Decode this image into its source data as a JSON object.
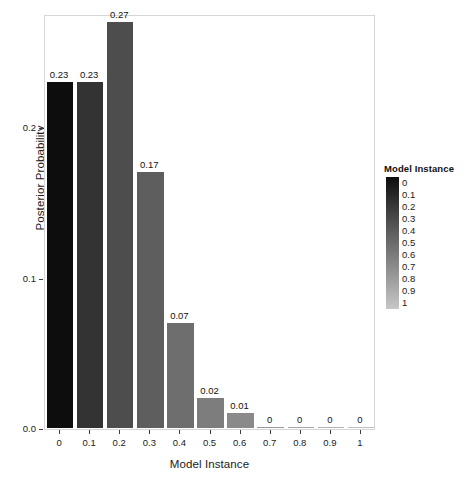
{
  "chart_data": {
    "type": "bar",
    "title": "",
    "xlabel": "Model Instance",
    "ylabel": "Posterior Probability",
    "categories": [
      "0",
      "0.1",
      "0.2",
      "0.3",
      "0.4",
      "0.5",
      "0.6",
      "0.7",
      "0.8",
      "0.9",
      "1"
    ],
    "values": [
      0.23,
      0.23,
      0.27,
      0.17,
      0.07,
      0.02,
      0.01,
      0,
      0,
      0,
      0
    ],
    "value_labels": [
      "0.23",
      "0.23",
      "0.27",
      "0.17",
      "0.07",
      "0.02",
      "0.01",
      "0",
      "0",
      "0",
      "0"
    ],
    "bar_colors": [
      "#0d0d0d",
      "#333333",
      "#4d4d4d",
      "#5e5e5e",
      "#6e6e6e",
      "#7d7d7d",
      "#8a8a8a",
      "#999999",
      "#a6a6a6",
      "#b3b3b3",
      "#bfbfbf"
    ],
    "ylim": [
      0,
      0.275
    ],
    "xlim_note": "categorical",
    "grid": false,
    "y_ticks": [
      {
        "value": 0.0,
        "label": "0.0"
      },
      {
        "value": 0.1,
        "label": "0.1"
      },
      {
        "value": 0.2,
        "label": "0.2"
      }
    ],
    "x_tick_labels": [
      "0",
      "0.1",
      "0.2",
      "0.3",
      "0.4",
      "0.5",
      "0.6",
      "0.7",
      "0.8",
      "0.9",
      "1"
    ],
    "legend": {
      "title": "Model Instance",
      "position": "right",
      "type": "continuous-colorbar",
      "gradient_from": "#0d0d0d",
      "gradient_to": "#c7c7c7",
      "keys": [
        "0",
        "0.1",
        "0.2",
        "0.3",
        "0.4",
        "0.5",
        "0.6",
        "0.7",
        "0.8",
        "0.9",
        "1"
      ]
    },
    "panel_border_color": "#d6d6d6",
    "background_color": "#ffffff"
  }
}
